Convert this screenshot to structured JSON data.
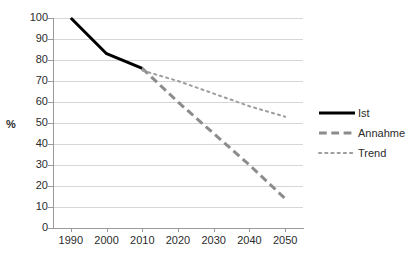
{
  "chart_data": {
    "type": "line",
    "title": "",
    "xlabel": "",
    "ylabel": "%",
    "xlim": [
      1985,
      2055
    ],
    "ylim": [
      0,
      100
    ],
    "grid": true,
    "legend_position": "right",
    "x_ticks": [
      "1990",
      "2000",
      "2010",
      "2020",
      "2030",
      "2040",
      "2050"
    ],
    "y_ticks": [
      "0",
      "10",
      "20",
      "30",
      "40",
      "50",
      "60",
      "70",
      "80",
      "90",
      "100"
    ],
    "series": [
      {
        "name": "Ist",
        "style": "solid",
        "color": "#000000",
        "width": 3,
        "x": [
          1990,
          2000,
          2010
        ],
        "values": [
          100,
          83,
          76
        ]
      },
      {
        "name": "Annahme",
        "style": "dashed",
        "color": "#8c8c8c",
        "width": 3,
        "x": [
          2010,
          2020,
          2030,
          2040,
          2050
        ],
        "values": [
          76,
          60,
          45,
          30,
          14
        ]
      },
      {
        "name": "Trend",
        "style": "dotted",
        "color": "#9e9e9e",
        "width": 2,
        "x": [
          2010,
          2020,
          2030,
          2040,
          2050
        ],
        "values": [
          75,
          70,
          64,
          58,
          53
        ]
      }
    ]
  },
  "legend": {
    "items": [
      {
        "label": "Ist"
      },
      {
        "label": "Annahme"
      },
      {
        "label": "Trend"
      }
    ]
  },
  "axis": {
    "y_title": "%"
  }
}
